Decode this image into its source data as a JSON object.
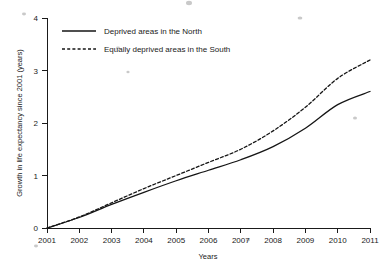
{
  "chart_data": {
    "type": "line",
    "title": "",
    "xlabel": "Years",
    "ylabel": "Growth in life expectancy since 2001 (years)",
    "x": [
      2001,
      2002,
      2003,
      2004,
      2005,
      2006,
      2007,
      2008,
      2009,
      2010,
      2011
    ],
    "xtick_labels": [
      "2001",
      "2002",
      "2003",
      "2004",
      "2005",
      "2006",
      "2007",
      "2008",
      "2009",
      "2010",
      "2011"
    ],
    "ytick_labels": [
      "0",
      "1",
      "2",
      "3",
      "4"
    ],
    "yticks": [
      0,
      1,
      2,
      3,
      4
    ],
    "xlim": [
      2001,
      2011
    ],
    "ylim": [
      0,
      4
    ],
    "grid": false,
    "legend_position": "upper left",
    "series": [
      {
        "name": "Deprived areas in the North",
        "style": "solid",
        "color": "#151515",
        "values": [
          0,
          0.2,
          0.45,
          0.68,
          0.9,
          1.1,
          1.3,
          1.55,
          1.9,
          2.35,
          2.6
        ]
      },
      {
        "name": "Equally deprived areas in the South",
        "style": "dashed",
        "color": "#151515",
        "values": [
          0,
          0.21,
          0.48,
          0.75,
          1.0,
          1.25,
          1.5,
          1.85,
          2.3,
          2.85,
          3.2
        ]
      }
    ]
  },
  "legend": {
    "items": [
      {
        "label": "Deprived areas in the North",
        "style": "solid"
      },
      {
        "label": "Equally deprived areas in the South",
        "style": "dashed"
      }
    ]
  },
  "axes": {
    "x_title": "Years",
    "y_title": "Growth in life expectancy since 2001 (years)"
  }
}
